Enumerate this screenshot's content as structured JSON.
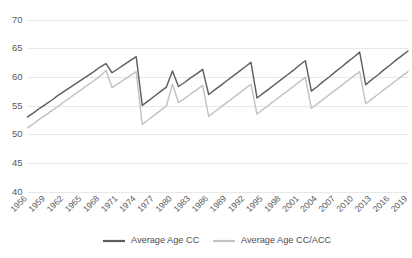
{
  "chart_data": {
    "type": "line",
    "title": "",
    "subtitle": "",
    "xlabel": "",
    "ylabel": "",
    "ylim": [
      40,
      70
    ],
    "yticks": [
      40,
      45,
      50,
      55,
      60,
      65,
      70
    ],
    "grid": true,
    "legend_position": "bottom",
    "xtick_step": 3,
    "xtick_labels": [
      "1956",
      "1959",
      "1962",
      "1965",
      "1968",
      "1971",
      "1974",
      "1977",
      "1980",
      "1983",
      "1986",
      "1989",
      "1992",
      "1995",
      "1998",
      "2001",
      "2004",
      "2007",
      "2010",
      "2013",
      "2016",
      "2019"
    ],
    "x": [
      1956,
      1957,
      1958,
      1959,
      1960,
      1961,
      1962,
      1963,
      1964,
      1965,
      1966,
      1967,
      1968,
      1969,
      1970,
      1971,
      1972,
      1973,
      1974,
      1975,
      1976,
      1977,
      1978,
      1979,
      1980,
      1981,
      1982,
      1983,
      1984,
      1985,
      1986,
      1987,
      1988,
      1989,
      1990,
      1991,
      1992,
      1993,
      1994,
      1995,
      1996,
      1997,
      1998,
      1999,
      2000,
      2001,
      2002,
      2003,
      2004,
      2005,
      2006,
      2007,
      2008,
      2009,
      2010,
      2011,
      2012,
      2013,
      2014,
      2015,
      2016,
      2017,
      2018,
      2019
    ],
    "series": [
      {
        "name": "Average Age CC",
        "color": "#5f5f5f",
        "values": [
          53.1,
          53.8,
          54.6,
          55.3,
          56.0,
          56.8,
          57.5,
          58.2,
          58.9,
          59.6,
          60.3,
          61.0,
          61.8,
          62.4,
          60.8,
          61.5,
          62.2,
          62.9,
          63.6,
          55.1,
          55.9,
          56.7,
          57.5,
          58.3,
          61.1,
          58.4,
          59.1,
          59.9,
          60.6,
          61.4,
          57.0,
          57.8,
          58.6,
          59.4,
          60.2,
          61.0,
          61.8,
          62.6,
          56.4,
          57.2,
          58.0,
          58.8,
          59.6,
          60.4,
          61.2,
          62.1,
          62.9,
          57.6,
          58.4,
          59.3,
          60.1,
          61.0,
          61.8,
          62.7,
          63.5,
          64.4,
          58.7,
          59.6,
          60.4,
          61.3,
          62.1,
          63.0,
          63.8,
          64.6
        ]
      },
      {
        "name": "Average Age CC/ACC",
        "color": "#c2c2c2",
        "values": [
          51.2,
          51.9,
          52.7,
          53.4,
          54.2,
          54.9,
          55.7,
          56.4,
          57.2,
          57.9,
          58.7,
          59.4,
          60.2,
          61.2,
          58.2,
          58.9,
          59.6,
          60.3,
          61.0,
          51.8,
          52.6,
          53.4,
          54.2,
          55.0,
          58.8,
          55.6,
          56.3,
          57.1,
          57.8,
          58.6,
          53.2,
          54.0,
          54.8,
          55.6,
          56.4,
          57.2,
          58.0,
          58.8,
          53.6,
          54.4,
          55.2,
          56.0,
          56.8,
          57.6,
          58.4,
          59.2,
          60.0,
          54.6,
          55.4,
          56.2,
          57.0,
          57.8,
          58.6,
          59.4,
          60.2,
          61.0,
          55.4,
          56.2,
          57.0,
          57.8,
          58.6,
          59.4,
          60.2,
          61.0
        ]
      }
    ]
  },
  "legend": {
    "items": [
      {
        "label": "Average Age CC",
        "color": "#5f5f5f"
      },
      {
        "label": "Average Age CC/ACC",
        "color": "#c2c2c2"
      }
    ]
  }
}
